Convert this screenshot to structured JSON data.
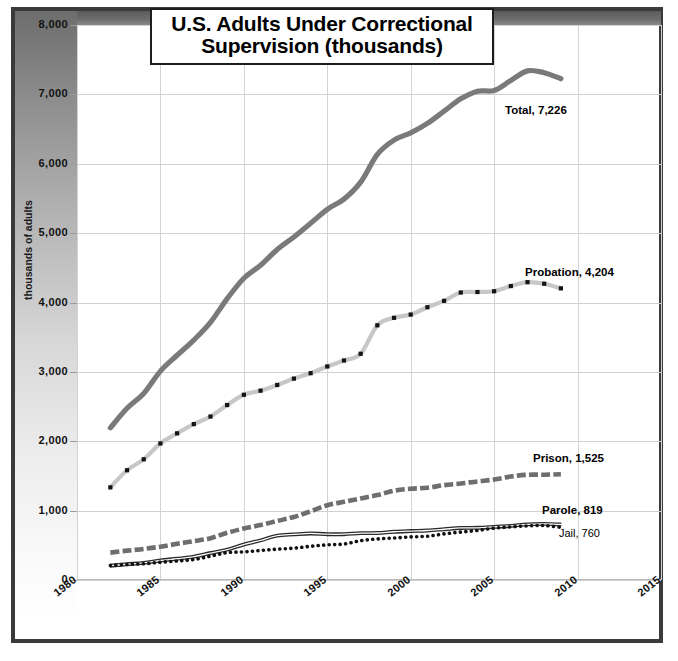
{
  "chart_data": {
    "type": "line",
    "title": "U.S. Adults Under Correctional Supervision (thousands)",
    "title_line1": "U.S. Adults Under Correctional",
    "title_line2": "Supervision (thousands)",
    "xlabel": "",
    "ylabel": "thousands of adults",
    "xlim": [
      1980,
      2015
    ],
    "ylim": [
      0,
      8000
    ],
    "xticks": [
      "1980",
      "1985",
      "1990",
      "1995",
      "2000",
      "2005",
      "2010",
      "2015"
    ],
    "yticks": [
      "0",
      "1,000",
      "2,000",
      "3,000",
      "4,000",
      "5,000",
      "6,000",
      "7,000",
      "8,000"
    ],
    "grid": true,
    "legend_position": "inline-right-of-line",
    "x": [
      1982,
      1983,
      1984,
      1985,
      1986,
      1987,
      1988,
      1989,
      1990,
      1991,
      1992,
      1993,
      1994,
      1995,
      1996,
      1997,
      1998,
      1999,
      2000,
      2001,
      2002,
      2003,
      2004,
      2005,
      2006,
      2007,
      2008,
      2009
    ],
    "series": [
      {
        "name": "Total",
        "label": "Total, 7,226",
        "end_value": 7226,
        "color": "#7a7a7a",
        "style": "solid-thick",
        "values": [
          2193,
          2475,
          2689,
          3011,
          3240,
          3459,
          3714,
          4055,
          4350,
          4536,
          4763,
          4944,
          5141,
          5343,
          5490,
          5735,
          6135,
          6341,
          6445,
          6582,
          6758,
          6936,
          7046,
          7056,
          7200,
          7339,
          7313,
          7226
        ]
      },
      {
        "name": "Probation",
        "label": "Probation, 4,204",
        "end_value": 4204,
        "color": "#c7c7c7",
        "marker": "square-dark",
        "style": "solid-markers",
        "values": [
          1335,
          1582,
          1740,
          1968,
          2114,
          2247,
          2356,
          2522,
          2670,
          2729,
          2811,
          2903,
          2981,
          3078,
          3164,
          3261,
          3671,
          3779,
          3826,
          3932,
          4024,
          4144,
          4151,
          4162,
          4237,
          4293,
          4271,
          4204
        ]
      },
      {
        "name": "Prison",
        "label": "Prison, 1,525",
        "end_value": 1525,
        "color": "#6e6e6e",
        "style": "dashed-thick",
        "values": [
          395,
          423,
          448,
          480,
          522,
          560,
          603,
          680,
          743,
          792,
          851,
          909,
          990,
          1078,
          1127,
          1176,
          1224,
          1287,
          1316,
          1330,
          1367,
          1390,
          1421,
          1448,
          1492,
          1517,
          1518,
          1525
        ]
      },
      {
        "name": "Parole",
        "label": "Parole, 819",
        "end_value": 819,
        "color": "#2b2b2b",
        "style": "solid-thin-double",
        "values": [
          225,
          246,
          266,
          300,
          325,
          355,
          407,
          456,
          531,
          590,
          658,
          676,
          690,
          679,
          679,
          694,
          696,
          714,
          724,
          732,
          750,
          769,
          771,
          784,
          799,
          821,
          828,
          819
        ]
      },
      {
        "name": "Jail",
        "label": "Jail, 760",
        "end_value": 760,
        "color": "#111111",
        "style": "dotted",
        "values": [
          210,
          224,
          234,
          256,
          274,
          295,
          343,
          395,
          405,
          426,
          444,
          459,
          486,
          507,
          518,
          567,
          592,
          605,
          621,
          631,
          665,
          691,
          714,
          747,
          766,
          780,
          785,
          760
        ]
      }
    ],
    "annotations": [
      {
        "text": "Total, 7,226",
        "series": "Total"
      },
      {
        "text": "Probation, 4,204",
        "series": "Probation"
      },
      {
        "text": "Prison, 1,525",
        "series": "Prison"
      },
      {
        "text": "Parole, 819",
        "series": "Parole"
      },
      {
        "text": "Jail, 760",
        "series": "Jail"
      }
    ],
    "colors": {
      "frame": "#3a3a3a",
      "grid": "#d3d3d3",
      "background": "#ffffff",
      "text": "#111111"
    }
  }
}
